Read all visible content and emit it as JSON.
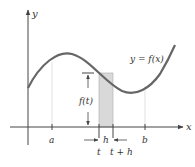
{
  "diagram": {
    "type": "calculus-area-under-curve",
    "axes": {
      "x_label": "x",
      "y_label": "y"
    },
    "curve": {
      "label": "y = f(x)"
    },
    "ticks": {
      "a": "a",
      "b": "b",
      "t": "t",
      "t_plus_h": "t + h"
    },
    "rectangle": {
      "width_label": "h",
      "height_label": "f(t)",
      "fill": "#d9d9d9"
    },
    "colors": {
      "curve": "#666666",
      "axes": "#444444",
      "guides": "#bbbbbb",
      "shade": "#d9d9d9"
    }
  }
}
